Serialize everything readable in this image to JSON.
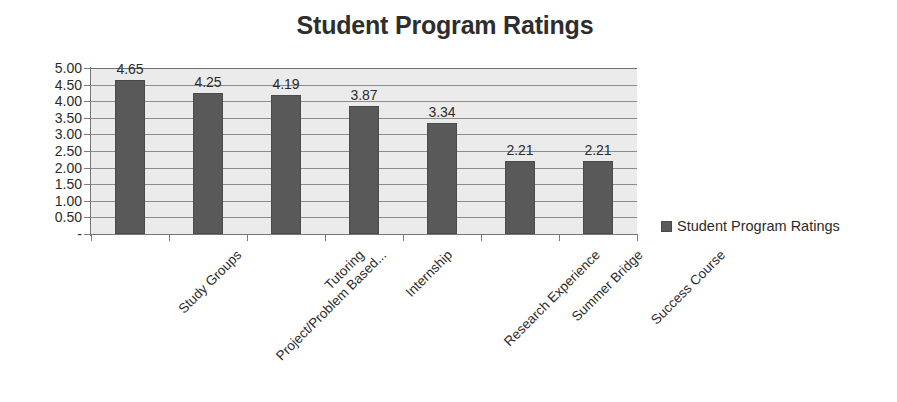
{
  "chart_data": {
    "type": "bar",
    "title": "Student Program Ratings",
    "categories": [
      "Study Groups",
      "Project/Problem Based...",
      "Tutoring",
      "Internship",
      "Research Experience",
      "Summer Bridge",
      "Success Course"
    ],
    "values": [
      4.65,
      4.25,
      4.19,
      3.87,
      3.34,
      2.21,
      2.21
    ],
    "value_labels": [
      "4.65",
      "4.25",
      "4.19",
      "3.87",
      "3.34",
      "2.21",
      "2.21"
    ],
    "series": [
      {
        "name": "Student Program Ratings",
        "values": [
          4.65,
          4.25,
          4.19,
          3.87,
          3.34,
          2.21,
          2.21
        ]
      }
    ],
    "xlabel": "",
    "ylabel": "",
    "ylim": [
      0,
      5
    ],
    "ytick_values": [
      5.0,
      4.5,
      4.0,
      3.5,
      3.0,
      2.5,
      2.0,
      1.5,
      1.0,
      0.5,
      0
    ],
    "ytick_labels": [
      "5.00",
      "4.50",
      "4.00",
      "3.50",
      "3.00",
      "2.50",
      "2.00",
      "1.50",
      "1.00",
      "0.50",
      "-"
    ],
    "grid": true,
    "grid_axis": "y",
    "legend": {
      "position": "right",
      "entries": [
        {
          "label": "Student Program Ratings",
          "color": "#595959"
        }
      ]
    },
    "colors": {
      "bar": "#595959",
      "bar_border": "#4a4a4a",
      "plot_background": "#ebebeb",
      "gridline": "#8c8c8c",
      "axis": "#767676",
      "text": "#2b2b2b",
      "page_background": "#ffffff"
    }
  }
}
